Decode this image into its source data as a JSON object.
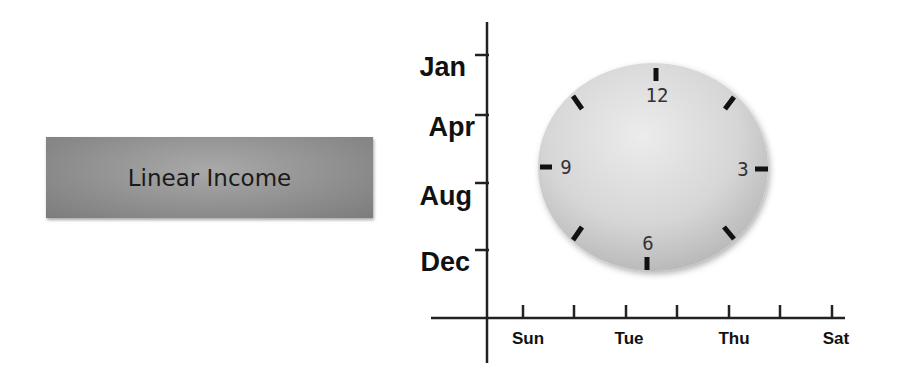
{
  "box": {
    "label": "Linear Income"
  },
  "axes": {
    "y_labels": [
      "Jan",
      "Apr",
      "Aug",
      "Dec"
    ],
    "x_labels": [
      "Sun",
      "Tue",
      "Thu",
      "Sat"
    ]
  },
  "clock": {
    "numbers": {
      "top": "12",
      "right": "3",
      "bottom": "6",
      "left": "9"
    }
  },
  "colors": {
    "box": "#959595",
    "axis": "#222222",
    "clock_face": "#dcdcdc"
  }
}
